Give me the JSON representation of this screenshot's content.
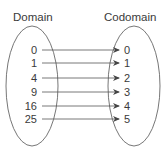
{
  "diagram": {
    "domain_title": "Domain",
    "codomain_title": "Codomain",
    "domain_values": [
      "0",
      "1",
      "4",
      "9",
      "16",
      "25"
    ],
    "codomain_values": [
      "0",
      "1",
      "2",
      "3",
      "4",
      "5"
    ],
    "mappings": [
      {
        "from": "0",
        "to": "0"
      },
      {
        "from": "1",
        "to": "1"
      },
      {
        "from": "4",
        "to": "2"
      },
      {
        "from": "9",
        "to": "3"
      },
      {
        "from": "16",
        "to": "4"
      },
      {
        "from": "25",
        "to": "5"
      }
    ],
    "stroke_color": "#555555"
  }
}
